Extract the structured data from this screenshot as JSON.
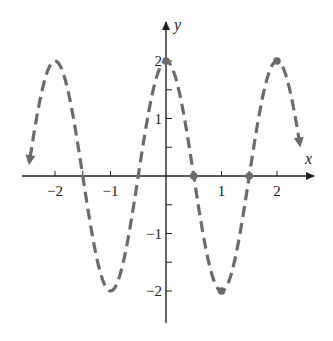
{
  "chart_data": {
    "type": "line",
    "title": "",
    "function": "y = 2cos(πx)",
    "xlabel": "x",
    "ylabel": "y",
    "xlim": [
      -2.45,
      2.4
    ],
    "ylim": [
      -2.6,
      2.6
    ],
    "grid": false,
    "x_ticks": [
      -2,
      -1,
      1,
      2
    ],
    "x_tick_labels": [
      "−2",
      "−1",
      "1",
      "2"
    ],
    "x_minor_ticks": [
      -2,
      -1.5,
      -1,
      -0.5,
      0.5,
      1,
      1.5,
      2
    ],
    "y_ticks": [
      2,
      1,
      -1,
      -2
    ],
    "y_tick_labels": [
      "2",
      "1",
      "−1",
      "−2"
    ],
    "y_minor_ticks": [
      2,
      1.5,
      1,
      0.5,
      -0.5,
      -1,
      -1.5,
      -2
    ],
    "series": [
      {
        "name": "2cos(πx)",
        "style": "dashed",
        "color": "#6b6b6b",
        "arrows_at_ends": true,
        "x_range": [
          -2.45,
          2.4
        ]
      }
    ],
    "highlighted_points": [
      {
        "x": 0,
        "y": 2
      },
      {
        "x": 0.5,
        "y": 0
      },
      {
        "x": 1,
        "y": -2
      },
      {
        "x": 1.5,
        "y": 0
      },
      {
        "x": 2,
        "y": 2
      }
    ],
    "colors": {
      "curve": "#6b6b6b",
      "axes": "#222222"
    }
  }
}
